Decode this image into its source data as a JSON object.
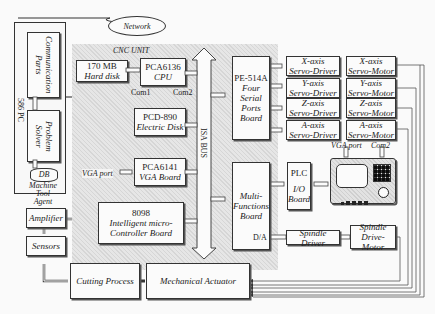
{
  "network": "Network",
  "pc": {
    "label": "586 PC",
    "communication": "Communication Parts",
    "solver": "Problem Solver",
    "db": "DB",
    "agent": [
      "Machine",
      "Tool",
      "Agent"
    ]
  },
  "cnc_unit": {
    "label": "CNC UNIT",
    "harddisk": {
      "line1": "170 MB",
      "line2": "Hard disk"
    },
    "cpu": {
      "line1": "PCA6136",
      "line2": "CPU"
    },
    "com1": "Com1",
    "com2": "Com2",
    "edisk": {
      "line1": "PCD-890",
      "line2": "Electric Disk"
    },
    "vga_port": "VGA port",
    "vga": {
      "line1": "PCA6141",
      "line2": "VGA Board"
    },
    "mcu": {
      "line1": "8098",
      "line2": "Intelligent micro-",
      "line3": "Controller Board"
    },
    "bus": "ISA BUS",
    "serial": {
      "line1": "PE-514A",
      "line2": "Four",
      "line3": "Serial",
      "line4": "Ports",
      "line5": "Board"
    },
    "multi": {
      "line1": "Multi-",
      "line2": "Functions",
      "line3": "Board"
    },
    "da": "D/A"
  },
  "drivers": [
    {
      "axis": "X-axis",
      "driver": "Servo-Driver",
      "motor": "Servo-Motor"
    },
    {
      "axis": "Y-axis",
      "driver": "Servo-Driver",
      "motor": "Servo-Motor"
    },
    {
      "axis": "Z-axis",
      "driver": "Servo-Driver",
      "motor": "Servo-Motor"
    },
    {
      "axis": "A-axis",
      "driver": "Servo-Driver",
      "motor": "Servo-Motor"
    }
  ],
  "plc": {
    "line1": "PLC",
    "line2": "I/O",
    "line3": "Board"
  },
  "panel": {
    "vga_port": "VGA port",
    "com2": "Com2"
  },
  "spindle_driver": "Spindle Driver",
  "spindle_motor": {
    "line1": "Spindle",
    "line2": "Drive-Motor"
  },
  "amplifier": "Amplifier",
  "sensors": "Sensors",
  "cutting": "Cutting Process",
  "actuator": "Mechanical Actuator"
}
